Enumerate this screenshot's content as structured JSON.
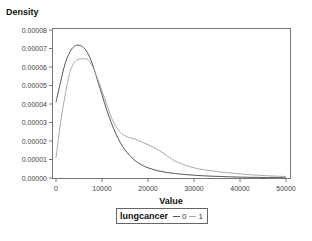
{
  "chart_data": {
    "type": "line",
    "title": "",
    "ylabel": "Density",
    "xlabel": "Value",
    "xlim": [
      0,
      50000
    ],
    "ylim": [
      0,
      8e-05
    ],
    "x_ticks": [
      0,
      10000,
      20000,
      30000,
      40000,
      50000
    ],
    "x_tick_labels": [
      "0",
      "10000",
      "20000",
      "30000",
      "40000",
      "50000"
    ],
    "y_ticks": [
      0,
      1e-05,
      2e-05,
      3e-05,
      4e-05,
      5e-05,
      6e-05,
      7e-05,
      8e-05
    ],
    "y_tick_labels": [
      "0.00000",
      "0.00001",
      "0.00002",
      "0.00003",
      "0.00004",
      "0.00005",
      "0.00006",
      "0.00007",
      "0.00008"
    ],
    "grid": false,
    "legend_position": "bottom",
    "legend_title": "lungcancer",
    "x": [
      0,
      1000,
      2000,
      3000,
      4000,
      5000,
      6000,
      7000,
      8000,
      9000,
      10000,
      11000,
      12000,
      13000,
      14000,
      15000,
      16000,
      17000,
      18000,
      19000,
      20000,
      21000,
      22000,
      23000,
      24000,
      25000,
      26000,
      28000,
      30000,
      32000,
      34000,
      36000,
      38000,
      40000,
      42000,
      44000,
      46000,
      48000,
      50000
    ],
    "series": [
      {
        "name": "0",
        "color": "#555555",
        "values": [
          4.1e-05,
          5.2e-05,
          6.2e-05,
          6.8e-05,
          7.12e-05,
          7.18e-05,
          7.05e-05,
          6.7e-05,
          6.1e-05,
          5.3e-05,
          4.5e-05,
          3.7e-05,
          3e-05,
          2.4e-05,
          1.9e-05,
          1.52e-05,
          1.22e-05,
          9.8e-06,
          8e-06,
          6.6e-06,
          5.5e-06,
          4.7e-06,
          4e-06,
          3.5e-06,
          3e-06,
          2.7e-06,
          2.4e-06,
          1.9e-06,
          1.5e-06,
          1.2e-06,
          1e-06,
          8e-07,
          6e-07,
          5e-07,
          4e-07,
          3e-07,
          2e-07,
          2e-07,
          1e-07
        ]
      },
      {
        "name": "1",
        "color": "#aaaaaa",
        "values": [
          1.1e-05,
          3e-05,
          4.5e-05,
          5.7e-05,
          6.25e-05,
          6.42e-05,
          6.45e-05,
          6.38e-05,
          6e-05,
          5.4e-05,
          4.7e-05,
          4e-05,
          3.3e-05,
          2.8e-05,
          2.45e-05,
          2.28e-05,
          2.18e-05,
          2.12e-05,
          2.02e-05,
          1.9e-05,
          1.8e-05,
          1.68e-05,
          1.55e-05,
          1.4e-05,
          1.22e-05,
          1.05e-05,
          9e-06,
          7e-06,
          5.5e-06,
          4.5e-06,
          3.8e-06,
          3.2e-06,
          2.7e-06,
          2.2e-06,
          1.8e-06,
          1.5e-06,
          1.2e-06,
          1e-06,
          8e-07
        ]
      }
    ]
  },
  "legend": {
    "title": "lungcancer",
    "items": [
      {
        "label": "0",
        "color": "#555555"
      },
      {
        "label": "1",
        "color": "#aaaaaa"
      }
    ]
  },
  "axes": {
    "y_title": "Density",
    "x_title": "Value"
  }
}
